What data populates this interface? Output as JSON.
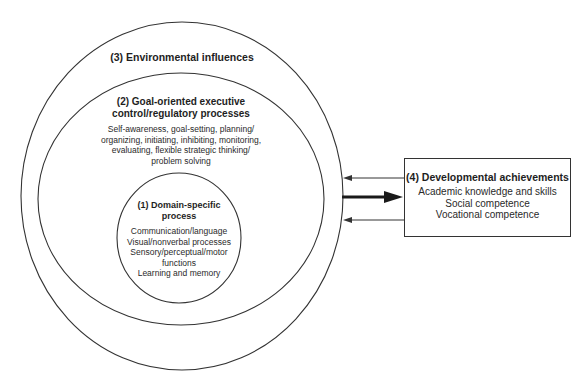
{
  "diagram": {
    "environmental": {
      "title": "(3) Environmental influences"
    },
    "executive": {
      "title_line1": "(2) Goal-oriented executive",
      "title_line2": "control/regulatory processes",
      "items": [
        "Self-awareness, goal-setting, planning/",
        "organizing, initiating, inhibiting, monitoring,",
        "evaluating, flexible strategic thinking/",
        "problem solving"
      ]
    },
    "domain": {
      "title_line1": "(1) Domain-specific",
      "title_line2": "process",
      "items": [
        "Communication/language",
        "Visual/nonverbal processes",
        "Sensory/perceptual/motor",
        "functions",
        "Learning and memory"
      ]
    },
    "achievements": {
      "title": "(4) Developmental achievements",
      "items": [
        "Academic knowledge and skills",
        "Social competence",
        "Vocational competence"
      ]
    },
    "arrows": [
      {
        "name": "feedback-top",
        "direction": "left",
        "weight": "thin"
      },
      {
        "name": "main-output",
        "direction": "right",
        "weight": "thick"
      },
      {
        "name": "feedback-bottom",
        "direction": "left",
        "weight": "thin"
      }
    ],
    "colors": {
      "line": "#333333",
      "text": "#222222",
      "background": "#ffffff"
    }
  }
}
